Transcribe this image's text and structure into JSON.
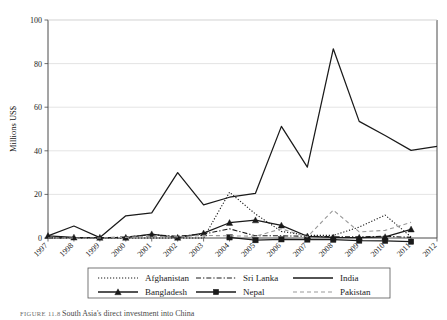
{
  "figure": {
    "caption_lead": "FIGURE 11.8",
    "caption_text": "South Asia's direct investment into China"
  },
  "chart_data": {
    "type": "line",
    "title": "",
    "xlabel": "",
    "ylabel": "Millions US$",
    "ylim": [
      0,
      100
    ],
    "yticks": [
      0,
      20,
      40,
      60,
      80,
      100
    ],
    "grid": true,
    "legend_position": "bottom",
    "categories": [
      "1997",
      "1998",
      "1999",
      "2000",
      "2001",
      "2002",
      "2003",
      "2004",
      "2005",
      "2006",
      "2007",
      "2008",
      "2009",
      "2010",
      "2011",
      "2012"
    ],
    "series": [
      {
        "name": "Afghanistan",
        "style": "dotted",
        "color": "#1a1a1a",
        "marker": "none",
        "values": [
          0,
          0,
          0,
          0,
          0,
          0,
          0,
          21.0,
          11.0,
          3.0,
          1.2,
          1.2,
          5.0,
          10.5,
          0.5,
          null
        ]
      },
      {
        "name": "Sri Lanka",
        "style": "dash-dot",
        "color": "#1a1a1a",
        "marker": "none",
        "values": [
          0,
          0.2,
          0,
          0.5,
          1.5,
          0.8,
          1.8,
          4.2,
          1.0,
          1.0,
          0.8,
          0.6,
          0.5,
          0.8,
          0.3,
          null
        ]
      },
      {
        "name": "India",
        "style": "solid",
        "color": "#1a1a1a",
        "marker": "none",
        "values": [
          1.0,
          5.5,
          0.2,
          10.2,
          11.5,
          30.0,
          15.2,
          18.7,
          20.5,
          51.2,
          32.5,
          86.8,
          53.5,
          47.0,
          40.2,
          42.0
        ]
      },
      {
        "name": "Bangladesh",
        "style": "solid",
        "color": "#1a1a1a",
        "marker": "triangle",
        "values": [
          1.0,
          0.3,
          0.2,
          0.2,
          1.8,
          0.2,
          2.2,
          7.0,
          8.2,
          5.8,
          0.8,
          0.3,
          0.2,
          0.5,
          4.0,
          null
        ]
      },
      {
        "name": "Nepal",
        "style": "solid",
        "color": "#1a1a1a",
        "marker": "square",
        "values": [
          null,
          null,
          null,
          null,
          null,
          null,
          null,
          0.3,
          -1.0,
          -0.6,
          -0.7,
          -0.8,
          -1.2,
          -1.3,
          -1.7,
          null
        ]
      },
      {
        "name": "Pakistan",
        "style": "dashed",
        "color": "#9a9a9a",
        "marker": "none",
        "values": [
          0,
          0,
          0,
          0.3,
          0.8,
          0.5,
          1.2,
          1.0,
          0.8,
          4.2,
          0.5,
          12.8,
          2.8,
          3.5,
          7.2,
          null
        ]
      }
    ]
  },
  "legend": {
    "rows": [
      [
        {
          "label": "Afghanistan",
          "style": "dotted",
          "marker": "none",
          "color": "#1a1a1a"
        },
        {
          "label": "Sri Lanka",
          "style": "dash-dot",
          "marker": "none",
          "color": "#1a1a1a"
        },
        {
          "label": "India",
          "style": "solid",
          "marker": "none",
          "color": "#1a1a1a"
        }
      ],
      [
        {
          "label": "Bangladesh",
          "style": "solid",
          "marker": "triangle",
          "color": "#1a1a1a"
        },
        {
          "label": "Nepal",
          "style": "solid",
          "marker": "square",
          "color": "#1a1a1a"
        },
        {
          "label": "Pakistan",
          "style": "dashed",
          "marker": "none",
          "color": "#9a9a9a"
        }
      ]
    ]
  }
}
